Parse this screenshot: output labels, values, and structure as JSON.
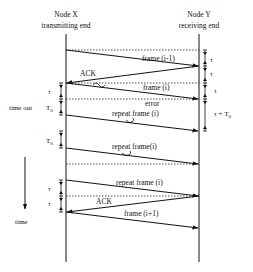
{
  "diagram": {
    "nodes": {
      "left": {
        "title": "Node X",
        "subtitle": "transmitting end"
      },
      "right": {
        "title": "Node Y",
        "subtitle": "receiving end"
      }
    },
    "messages": [
      {
        "label": "frame (i-1)",
        "from": "X",
        "to": "Y"
      },
      {
        "label": "ACK",
        "from": "Y",
        "to": "X"
      },
      {
        "label": "frame (i)",
        "from": "X",
        "to": "Y",
        "corrupted": true
      },
      {
        "label": "repeat frame (i)",
        "from": "X",
        "to": "Y",
        "corrupted": true
      },
      {
        "label": "repeat frame(i)",
        "from": "X",
        "to": "Y",
        "corrupted": true
      },
      {
        "label": "repeat frame (i)",
        "from": "X",
        "to": "Y"
      },
      {
        "label": "ACK",
        "from": "Y",
        "to": "X"
      },
      {
        "label": "frame (i+1)",
        "from": "X",
        "to": "Y"
      }
    ],
    "annotations": {
      "error": "error",
      "time_out": "time out",
      "time": "time",
      "tau": "τ",
      "t0": "T",
      "t0_sub": "0",
      "tau_plus_t0": "τ + T",
      "tau_plus_t0_sub": "0"
    }
  }
}
